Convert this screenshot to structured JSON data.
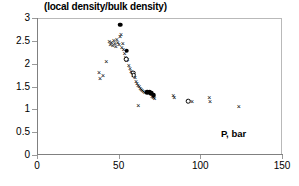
{
  "chart_data": {
    "type": "scatter",
    "title": "(local density/bulk density)",
    "xlabel": "P, bar",
    "ylabel": "",
    "xlim": [
      0,
      150
    ],
    "ylim": [
      0,
      3
    ],
    "xticks": [
      0,
      50,
      100,
      150
    ],
    "yticks": [
      0,
      0.5,
      1,
      1.5,
      2,
      2.5,
      3
    ],
    "xtick_labels": [
      "0",
      "50",
      "100",
      "150"
    ],
    "ytick_labels": [
      "0",
      "0.5",
      "1",
      "1.5",
      "2",
      "2.5",
      "3"
    ],
    "grid": false,
    "legend": "none",
    "frame": true,
    "series": [
      {
        "name": "cross-markers",
        "marker": "x",
        "color": "#000000",
        "points": [
          [
            38.0,
            1.8
          ],
          [
            38.6,
            1.67
          ],
          [
            40.5,
            1.73
          ],
          [
            42.5,
            2.04
          ],
          [
            44.3,
            2.47
          ],
          [
            44.8,
            2.4
          ],
          [
            45.6,
            2.45
          ],
          [
            46.4,
            2.38
          ],
          [
            47.0,
            2.5
          ],
          [
            47.6,
            2.43
          ],
          [
            48.3,
            2.36
          ],
          [
            48.9,
            2.52
          ],
          [
            49.5,
            2.46
          ],
          [
            50.2,
            2.41
          ],
          [
            50.8,
            2.58
          ],
          [
            51.4,
            2.62
          ],
          [
            51.9,
            2.34
          ],
          [
            52.5,
            2.44
          ],
          [
            53.0,
            2.3
          ],
          [
            53.6,
            2.22
          ],
          [
            54.2,
            2.12
          ],
          [
            54.9,
            2.05
          ],
          [
            55.5,
            2.08
          ],
          [
            56.2,
            1.95
          ],
          [
            56.9,
            1.88
          ],
          [
            57.6,
            1.82
          ],
          [
            58.2,
            1.79
          ],
          [
            58.8,
            1.72
          ],
          [
            59.4,
            1.74
          ],
          [
            60.0,
            1.68
          ],
          [
            60.7,
            1.6
          ],
          [
            61.3,
            1.56
          ],
          [
            61.9,
            1.52
          ],
          [
            62.6,
            1.48
          ],
          [
            63.2,
            1.44
          ],
          [
            63.9,
            1.42
          ],
          [
            62.0,
            1.07
          ],
          [
            64.5,
            1.4
          ],
          [
            65.2,
            1.38
          ],
          [
            66.0,
            1.36
          ],
          [
            70.5,
            1.28
          ],
          [
            71.2,
            1.24
          ],
          [
            72.0,
            1.22
          ],
          [
            83.5,
            1.3
          ],
          [
            84.0,
            1.24
          ],
          [
            95.0,
            1.16
          ],
          [
            105.5,
            1.24
          ],
          [
            106.0,
            1.15
          ],
          [
            123.5,
            1.05
          ]
        ]
      },
      {
        "name": "filled-circle-markers",
        "marker": "o-filled",
        "color": "#000000",
        "points": [
          [
            51.0,
            2.85
          ],
          [
            55.0,
            2.28
          ],
          [
            67.5,
            1.37
          ],
          [
            69.0,
            1.37
          ],
          [
            70.0,
            1.35
          ],
          [
            71.5,
            1.31
          ]
        ]
      },
      {
        "name": "open-circle-markers",
        "marker": "o-open",
        "color": "#000000",
        "points": [
          [
            54.6,
            2.1
          ],
          [
            59.0,
            1.8
          ],
          [
            59.2,
            1.75
          ],
          [
            92.5,
            1.18
          ]
        ]
      }
    ]
  }
}
